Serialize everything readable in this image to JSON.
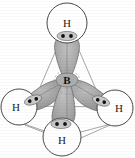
{
  "figure": {
    "center_atom": {
      "symbol": "B",
      "name": "boron-center",
      "x": 67,
      "y": 80
    },
    "hydrogens": [
      {
        "symbol": "H",
        "name": "hydrogen-top",
        "x": 67,
        "y": 23,
        "r": 20
      },
      {
        "symbol": "H",
        "name": "hydrogen-left",
        "x": 19,
        "y": 107,
        "r": 18
      },
      {
        "symbol": "H",
        "name": "hydrogen-right",
        "x": 115,
        "y": 108,
        "r": 18
      },
      {
        "symbol": "H",
        "name": "hydrogen-bottom-front",
        "x": 62,
        "y": 137,
        "r": 19
      }
    ],
    "electron_pairs": [
      {
        "name": "electron-pair-top",
        "x": 67,
        "y": 36,
        "angle": 0
      },
      {
        "name": "electron-pair-left",
        "x": 33,
        "y": 100,
        "angle": -18
      },
      {
        "name": "electron-pair-right",
        "x": 100,
        "y": 101,
        "angle": 18
      },
      {
        "name": "electron-pair-bottom-front",
        "x": 58,
        "y": 124,
        "angle": 0
      }
    ],
    "lobes": [
      {
        "name": "sp3-lobe-top",
        "direction": "up"
      },
      {
        "name": "sp3-lobe-left",
        "direction": "lower-left"
      },
      {
        "name": "sp3-lobe-right",
        "direction": "lower-right"
      },
      {
        "name": "sp3-lobe-bottom-front",
        "direction": "down-front"
      }
    ],
    "tetrahedron_edges": [
      {
        "name": "edge-top-left"
      },
      {
        "name": "edge-top-right"
      },
      {
        "name": "edge-left-bottom"
      },
      {
        "name": "edge-right-bottom"
      },
      {
        "name": "edge-left-right-back"
      }
    ],
    "colors": {
      "lobe_fill": "#9b9b9b",
      "lobe_fill_light": "#b4b4b4",
      "lobe_stroke": "#6e6e6e",
      "circle_stroke": "#4a4a4a",
      "circle_fill": "#ffffff",
      "edge_line": "#8a8a8a",
      "dot": "#141414",
      "background": "#ffffff",
      "label_text": "#1a1a1a"
    },
    "caption": ""
  }
}
